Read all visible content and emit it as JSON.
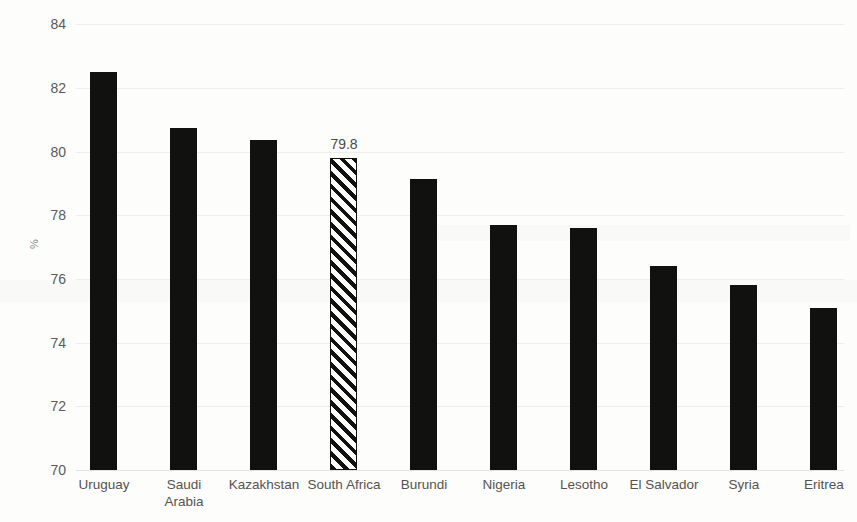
{
  "chart_data": {
    "type": "bar",
    "title": "",
    "subtitle": "",
    "xlabel": "",
    "ylabel": "%",
    "ylim": [
      70,
      84
    ],
    "ytick_step": 2,
    "yticks": [
      84,
      82,
      80,
      78,
      76,
      74,
      72,
      70
    ],
    "ytick_labels": [
      "84",
      "82",
      "80",
      "78",
      "76",
      "74",
      "72",
      "70"
    ],
    "grid": true,
    "grid_axis": "y",
    "legend": null,
    "categories": [
      "Uruguay",
      "Saudi\nArabia",
      "Kazakhstan",
      "South Africa",
      "Burundi",
      "Nigeria",
      "Lesotho",
      "El Salvador",
      "Syria",
      "Eritrea"
    ],
    "values": [
      82.5,
      80.75,
      80.35,
      79.8,
      79.15,
      77.7,
      77.6,
      76.4,
      75.8,
      75.1
    ],
    "bar_labels": [
      "",
      "",
      "",
      "79.8",
      "",
      "",
      "",
      "",
      "",
      ""
    ],
    "highlight_index": 3,
    "bar_fill": "#111110",
    "highlight_fill": "hatched-diagonal",
    "highlight_outline": "#111110",
    "gridline_color": "#ededec",
    "tick_label_color": "#5a5a58",
    "category_label_color": "#55534f",
    "background": "#fdfdfc"
  }
}
